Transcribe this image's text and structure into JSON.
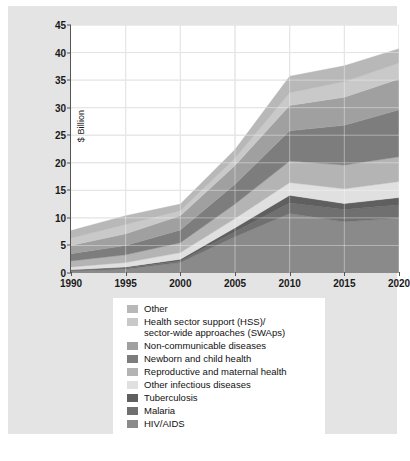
{
  "chart_data": {
    "type": "area",
    "stacked": true,
    "title": "",
    "xlabel": "",
    "ylabel": "$ Billion",
    "x": [
      1990,
      1995,
      2000,
      2005,
      2010,
      2015,
      2020
    ],
    "xtick_labels": [
      "1990",
      "1995",
      "2000",
      "2005",
      "2010",
      "2015",
      "2020"
    ],
    "ytick_labels": [
      "0",
      "5",
      "10",
      "15",
      "20",
      "25",
      "30",
      "35",
      "40",
      "45"
    ],
    "yticks": [
      0,
      5,
      10,
      15,
      20,
      25,
      30,
      35,
      40,
      45
    ],
    "ylim": [
      0,
      45
    ],
    "xlim": [
      1990,
      2020
    ],
    "grid": true,
    "legend_position": "below",
    "stack_order_bottom_to_top": [
      "HIV/AIDS",
      "Malaria",
      "Tuberculosis",
      "Other infectious diseases",
      "Reproductive and maternal health",
      "Newborn and child health",
      "Non-communicable diseases",
      "Health sector support (HSS)/ sector-wide approaches (SWAps)",
      "Other"
    ],
    "series": [
      {
        "name": "HIV/AIDS",
        "color": "#8a8a8a",
        "values": [
          0.4,
          0.7,
          1.9,
          6.6,
          10.8,
          9.3,
          10.0
        ]
      },
      {
        "name": "Malaria",
        "color": "#707070",
        "values": [
          0.1,
          0.2,
          0.3,
          0.9,
          1.9,
          2.2,
          2.4
        ]
      },
      {
        "name": "Tuberculosis",
        "color": "#5f5f5f",
        "values": [
          0.1,
          0.2,
          0.3,
          0.7,
          1.4,
          1.1,
          1.3
        ]
      },
      {
        "name": "Other infectious diseases",
        "color": "#e0e0e0",
        "values": [
          0.5,
          0.8,
          1.2,
          1.7,
          2.3,
          2.7,
          2.9
        ]
      },
      {
        "name": "Reproductive and maternal health",
        "color": "#b4b4b4",
        "values": [
          1.1,
          1.4,
          1.8,
          2.6,
          3.9,
          4.3,
          4.5
        ]
      },
      {
        "name": "Newborn and child health",
        "color": "#7d7d7d",
        "values": [
          1.3,
          1.7,
          2.3,
          3.6,
          5.5,
          7.2,
          8.5
        ]
      },
      {
        "name": "Non-communicable diseases",
        "color": "#a0a0a0",
        "values": [
          1.5,
          2.1,
          2.6,
          3.4,
          4.6,
          5.1,
          5.6
        ]
      },
      {
        "name": "Health sector support (HSS)/ sector-wide approaches (SWAps)",
        "color": "#c9c9c9",
        "values": [
          1.3,
          1.7,
          0.9,
          1.3,
          2.3,
          2.8,
          2.9
        ]
      },
      {
        "name": "Other",
        "color": "#b8b8b8",
        "values": [
          1.4,
          1.6,
          1.2,
          1.6,
          3.0,
          2.9,
          2.6
        ]
      }
    ],
    "totals": [
      7.7,
      10.4,
      12.5,
      22.4,
      35.7,
      37.6,
      40.7
    ],
    "annotations": []
  },
  "legend": {
    "items": [
      {
        "label": "Other",
        "color": "#b8b8b8"
      },
      {
        "label": "Health sector support (HSS)/\nsector-wide approaches (SWAps)",
        "color": "#c9c9c9"
      },
      {
        "label": "Non-communicable diseases",
        "color": "#a0a0a0"
      },
      {
        "label": "Newborn and child health",
        "color": "#7d7d7d"
      },
      {
        "label": "Reproductive and maternal health",
        "color": "#b4b4b4"
      },
      {
        "label": "Other infectious diseases",
        "color": "#e0e0e0"
      },
      {
        "label": "Tuberculosis",
        "color": "#5f5f5f"
      },
      {
        "label": "Malaria",
        "color": "#707070"
      },
      {
        "label": "HIV/AIDS",
        "color": "#8a8a8a"
      }
    ]
  }
}
